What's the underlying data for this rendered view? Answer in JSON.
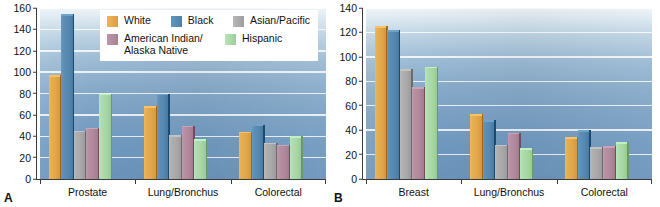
{
  "figure": {
    "panels": [
      {
        "letter": "A",
        "categories": [
          "Prostate",
          "Lung/Bronchus",
          "Colorectal"
        ],
        "ylim": [
          0,
          160
        ],
        "yticks": [
          0,
          20,
          40,
          60,
          80,
          100,
          120,
          140,
          160
        ]
      },
      {
        "letter": "B",
        "categories": [
          "Breast",
          "Lung/Bronchus",
          "Colorectal"
        ],
        "ylim": [
          0,
          140
        ],
        "yticks": [
          0,
          20,
          40,
          60,
          80,
          100,
          120,
          140
        ]
      }
    ]
  },
  "legend": {
    "position": "top-center-panel-a",
    "rows": [
      [
        {
          "label": "White",
          "color": "#e0a84a"
        },
        {
          "label": "Black",
          "color": "#5688b0"
        },
        {
          "label": "Asian/Pacific",
          "color": "#a9a9a9"
        }
      ],
      [
        {
          "label": "American Indian/\nAlaska Native",
          "color": "#b08a9c"
        },
        {
          "label": "Hispanic",
          "color": "#a7d7a7"
        }
      ]
    ]
  },
  "colors": {
    "white_race": "#e0a84a",
    "black_race": "#5688b0",
    "asian_pacific": "#a9a9a9",
    "american_indian": "#b08a9c",
    "hispanic": "#a7d7a7",
    "plot_background_top": "#eef4f8",
    "plot_background_bottom": "#6b93ba",
    "gridline": "#ffffff",
    "axis": "#3a3a3a",
    "text": "#111111"
  },
  "chart_data": [
    {
      "type": "bar",
      "panel": "A",
      "title": "",
      "xlabel": "",
      "ylabel": "",
      "ylim": [
        0,
        160
      ],
      "yticks": [
        0,
        20,
        40,
        60,
        80,
        100,
        120,
        140,
        160
      ],
      "grid": true,
      "legend_position": "upper center",
      "categories": [
        "Prostate",
        "Lung/Bronchus",
        "Colorectal"
      ],
      "series": [
        {
          "name": "White",
          "color": "#e0a84a",
          "values": [
            97,
            68,
            44
          ]
        },
        {
          "name": "Black",
          "color": "#5688b0",
          "values": [
            154,
            80,
            51
          ]
        },
        {
          "name": "Asian/Pacific",
          "color": "#a9a9a9",
          "values": [
            45,
            41,
            34
          ]
        },
        {
          "name": "American Indian/Alaska Native",
          "color": "#b08a9c",
          "values": [
            48,
            50,
            32
          ]
        },
        {
          "name": "Hispanic",
          "color": "#a7d7a7",
          "values": [
            80,
            37,
            40
          ]
        }
      ]
    },
    {
      "type": "bar",
      "panel": "B",
      "title": "",
      "xlabel": "",
      "ylabel": "",
      "ylim": [
        0,
        140
      ],
      "yticks": [
        0,
        20,
        40,
        60,
        80,
        100,
        120,
        140
      ],
      "grid": true,
      "legend_position": "none",
      "categories": [
        "Breast",
        "Lung/Bronchus",
        "Colorectal"
      ],
      "series": [
        {
          "name": "White",
          "color": "#e0a84a",
          "values": [
            125,
            53,
            34
          ]
        },
        {
          "name": "Black",
          "color": "#5688b0",
          "values": [
            122,
            48,
            40
          ]
        },
        {
          "name": "Asian/Pacific",
          "color": "#a9a9a9",
          "values": [
            90,
            28,
            26
          ]
        },
        {
          "name": "American Indian/Alaska Native",
          "color": "#b08a9c",
          "values": [
            75,
            38,
            27
          ]
        },
        {
          "name": "Hispanic",
          "color": "#a7d7a7",
          "values": [
            92,
            25,
            30
          ]
        }
      ]
    }
  ]
}
